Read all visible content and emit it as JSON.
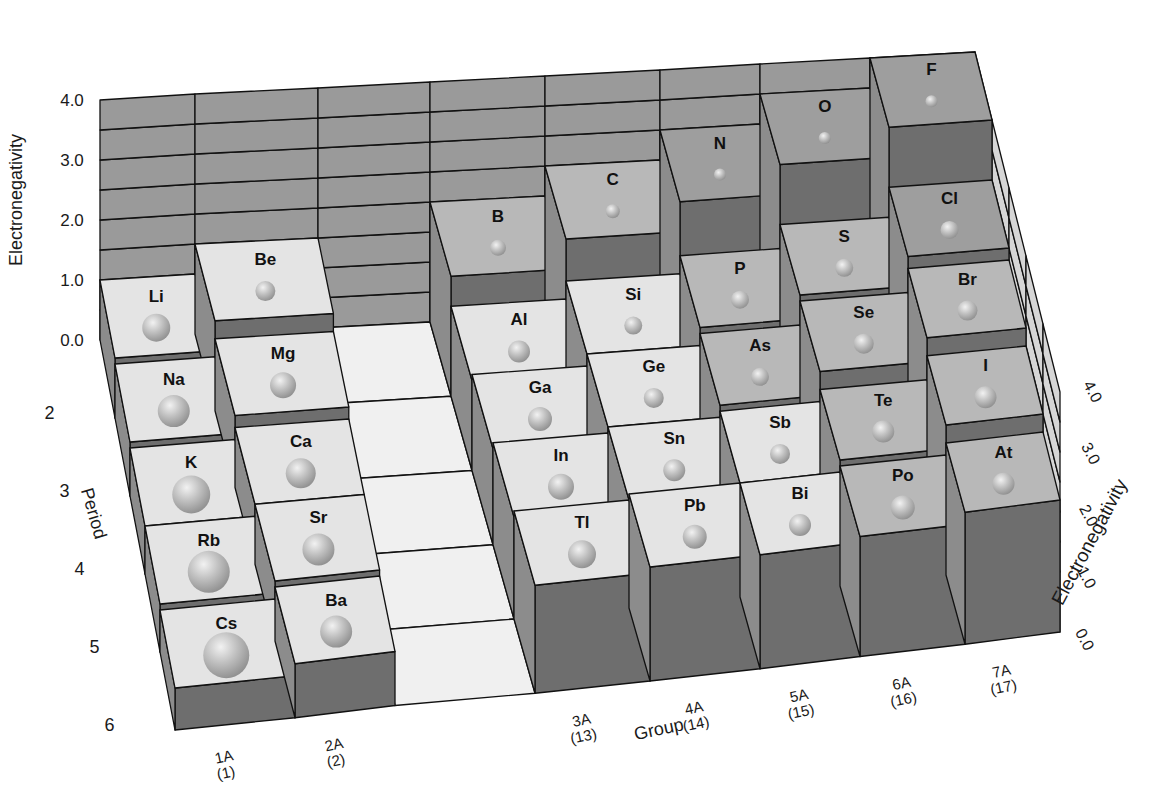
{
  "chart_data": {
    "type": "bar3d",
    "title": "",
    "xlabel": "Group",
    "ylabel": "Period",
    "zlabel": "Electronegativity",
    "z_ticks": [
      "0.0",
      "1.0",
      "2.0",
      "3.0",
      "4.0"
    ],
    "zlim": [
      0,
      4.0
    ],
    "period_ticks": [
      "2",
      "3",
      "4",
      "5",
      "6"
    ],
    "group_ticks": [
      {
        "main": "1A",
        "sub": "(1)"
      },
      {
        "main": "2A",
        "sub": "(2)"
      },
      {
        "main": "3A",
        "sub": "(13)"
      },
      {
        "main": "4A",
        "sub": "(14)"
      },
      {
        "main": "5A",
        "sub": "(15)"
      },
      {
        "main": "6A",
        "sub": "(16)"
      },
      {
        "main": "7A",
        "sub": "(17)"
      }
    ],
    "groups": [
      "1A",
      "2A",
      "3A",
      "4A",
      "5A",
      "6A",
      "7A"
    ],
    "periods": [
      2,
      3,
      4,
      5,
      6
    ],
    "series": [
      {
        "name": "1A",
        "elements": [
          "Li",
          "Na",
          "K",
          "Rb",
          "Cs"
        ],
        "values": [
          1.0,
          0.9,
          0.8,
          0.8,
          0.7
        ]
      },
      {
        "name": "2A",
        "elements": [
          "Be",
          "Mg",
          "Ca",
          "Sr",
          "Ba"
        ],
        "values": [
          1.5,
          1.2,
          1.0,
          1.0,
          0.9
        ]
      },
      {
        "name": "3A",
        "elements": [
          "B",
          "Al",
          "Ga",
          "In",
          "Tl"
        ],
        "values": [
          2.0,
          1.5,
          1.6,
          1.7,
          1.8
        ]
      },
      {
        "name": "4A",
        "elements": [
          "C",
          "Si",
          "Ge",
          "Sn",
          "Pb"
        ],
        "values": [
          2.5,
          1.8,
          1.8,
          1.8,
          1.9
        ]
      },
      {
        "name": "5A",
        "elements": [
          "N",
          "P",
          "As",
          "Sb",
          "Bi"
        ],
        "values": [
          3.0,
          2.1,
          2.0,
          1.9,
          1.9
        ]
      },
      {
        "name": "6A",
        "elements": [
          "O",
          "S",
          "Se",
          "Te",
          "Po"
        ],
        "values": [
          3.5,
          2.5,
          2.4,
          2.1,
          2.0
        ]
      },
      {
        "name": "7A",
        "elements": [
          "F",
          "Cl",
          "Br",
          "I",
          "At"
        ],
        "values": [
          4.0,
          3.0,
          2.8,
          2.5,
          2.2
        ]
      }
    ],
    "legend": "sphere size indicates relative atomic size",
    "grid": true
  }
}
